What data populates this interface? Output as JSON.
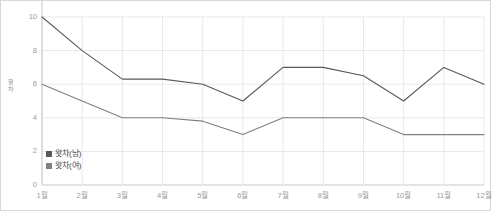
{
  "chart_data": {
    "type": "line",
    "title": "",
    "xlabel": "",
    "ylabel": "왓차",
    "categories": [
      "1월",
      "2월",
      "3월",
      "4월",
      "5월",
      "6월",
      "7월",
      "8월",
      "9월",
      "10월",
      "11월",
      "12월"
    ],
    "series": [
      {
        "name": "왓차(남)",
        "color": "#595959",
        "values": [
          10,
          8,
          6.3,
          6.3,
          6,
          5,
          7,
          7,
          6.5,
          5,
          7,
          6
        ]
      },
      {
        "name": "왓차(여)",
        "color": "#808080",
        "values": [
          6,
          5,
          4,
          4,
          3.8,
          3,
          4,
          4,
          4,
          3,
          3,
          3
        ]
      }
    ],
    "ylim": [
      0,
      10
    ],
    "y_ticks": [
      0,
      2,
      4,
      6,
      8,
      10
    ],
    "y_tick_labels": [
      "0",
      "2",
      "4",
      "6",
      "8",
      "10"
    ],
    "grid": true,
    "grid_color": "#e8e8e8",
    "legend_position": "inside-bottom-left",
    "axis_label_color": "#9b9b9b",
    "background_color": "#ffffff",
    "border_color": "#d8d8d8"
  }
}
